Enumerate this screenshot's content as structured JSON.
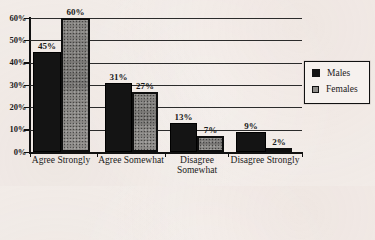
{
  "chart_data": {
    "type": "bar",
    "title": "",
    "xlabel": "",
    "ylabel": "",
    "categories": [
      "Agree Strongly",
      "Agree Somewhat",
      "Disagree Somewhat",
      "Disagree Strongly"
    ],
    "series": [
      {
        "name": "Males",
        "values": [
          45,
          31,
          13,
          9
        ]
      },
      {
        "name": "Females",
        "values": [
          60,
          27,
          7,
          2
        ]
      }
    ],
    "value_labels": {
      "Males": [
        "45%",
        "31%",
        "13%",
        "9%"
      ],
      "Females": [
        "60%",
        "27%",
        "7%",
        "2%"
      ]
    },
    "y_axis": {
      "min": 0,
      "max": 60,
      "ticks": [
        {
          "value": 0,
          "label": "0%"
        },
        {
          "value": 10,
          "label": "10%"
        },
        {
          "value": 20,
          "label": "20%"
        },
        {
          "value": 30,
          "label": "30%"
        },
        {
          "value": 40,
          "label": "40%"
        },
        {
          "value": 50,
          "label": "50%"
        },
        {
          "value": 60,
          "label": "60%"
        }
      ],
      "gridline_values": [
        10,
        20,
        30,
        40,
        50,
        60
      ]
    },
    "legend": {
      "position": "right",
      "entries": [
        "Males",
        "Females"
      ]
    },
    "grid": true,
    "colors": {
      "males_bar": "#141414",
      "females_bar": "#8f8d8a",
      "ink": "#1a1a1a",
      "paper": "#f2ece8"
    }
  }
}
